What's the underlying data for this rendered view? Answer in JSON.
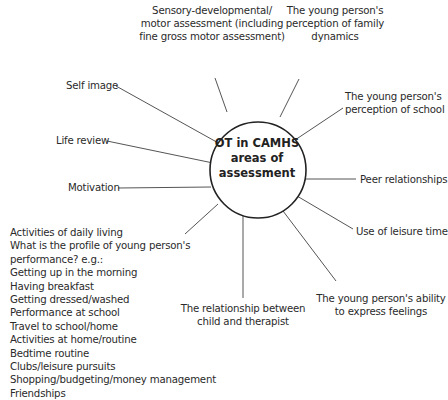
{
  "diagram": {
    "center": {
      "lines": [
        "OT in CAMHS",
        "areas of",
        "assessment"
      ]
    },
    "nodes": [
      {
        "id": "sensory",
        "lines": [
          "Sensory-developmental/",
          "motor assessment (including",
          "fine gross motor assessment)"
        ]
      },
      {
        "id": "family",
        "lines": [
          "The young person's",
          "perception of family",
          "dynamics"
        ]
      },
      {
        "id": "school",
        "lines": [
          "The young person's",
          "perception of school"
        ]
      },
      {
        "id": "peer",
        "lines": [
          "Peer relationships"
        ]
      },
      {
        "id": "leisure",
        "lines": [
          "Use of leisure time"
        ]
      },
      {
        "id": "feelings",
        "lines": [
          "The young person's ability",
          "to express feelings"
        ]
      },
      {
        "id": "relationship",
        "lines": [
          "The relationship between",
          "child and therapist"
        ]
      },
      {
        "id": "adl",
        "lines": [
          "Activities of daily living",
          "What is the profile of young person's",
          "performance? e.g.:",
          "Getting up in the morning",
          "Having breakfast",
          "Getting dressed/washed",
          "Performance at school",
          "Travel to school/home",
          "Activities at home/routine",
          "Bedtime routine",
          "Clubs/leisure pursuits",
          "Shopping/budgeting/money management",
          "Friendships"
        ]
      },
      {
        "id": "motivation",
        "lines": [
          "Motivation"
        ]
      },
      {
        "id": "life_review",
        "lines": [
          "Life review"
        ]
      },
      {
        "id": "self_image",
        "lines": [
          "Self image"
        ]
      }
    ],
    "colors": {
      "line": "#555555",
      "circle": "#222222",
      "text": "#2a2a2a"
    }
  }
}
